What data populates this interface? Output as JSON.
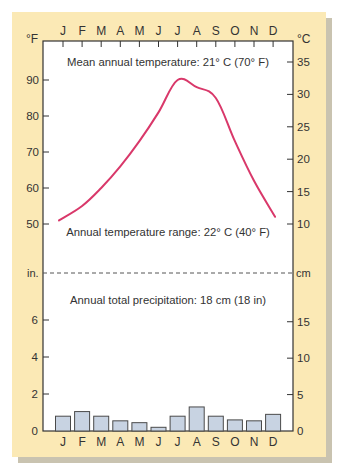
{
  "colors": {
    "panel": "#fbe9b5",
    "shadow": "#c9c3b0",
    "plot_bg": "#ffffff",
    "temp_line": "#d9386a",
    "bar_fill": "#c8d3e2",
    "bar_stroke": "#4a4a4a",
    "axis": "#333333"
  },
  "labels": {
    "left_top_unit": "°F",
    "right_top_unit": "°C",
    "left_precip_unit": "in.",
    "right_precip_unit": "cm",
    "mean_temp": "Mean annual temperature: 21° C (70° F)",
    "temp_range": "Annual temperature range: 22° C (40° F)",
    "precip_total": "Annual total precipitation: 18 cm (18 in)"
  },
  "chart_data": [
    {
      "type": "line",
      "title": "Mean annual temperature: 21° C (70° F)",
      "subtitle": "Annual temperature range: 22° C (40° F)",
      "categories": [
        "J",
        "F",
        "M",
        "A",
        "M",
        "J",
        "J",
        "A",
        "S",
        "O",
        "N",
        "D"
      ],
      "series": [
        {
          "name": "Temperature (°F)",
          "values": [
            51,
            55,
            60,
            66,
            73,
            81,
            90,
            88,
            85,
            73,
            62,
            52
          ]
        }
      ],
      "ylabel_left": "°F",
      "ylabel_right": "°C",
      "yticks_left": [
        50,
        60,
        70,
        80,
        90
      ],
      "yticks_right": [
        10,
        15,
        20,
        25,
        30,
        35
      ],
      "ylim": [
        45,
        97
      ],
      "grid": false,
      "legend": "none"
    },
    {
      "type": "bar",
      "title": "Annual total precipitation: 18 cm (18 in)",
      "categories": [
        "J",
        "F",
        "M",
        "A",
        "M",
        "J",
        "J",
        "A",
        "S",
        "O",
        "N",
        "D"
      ],
      "series": [
        {
          "name": "Precipitation (in)",
          "values": [
            0.8,
            1.05,
            0.8,
            0.55,
            0.45,
            0.2,
            0.8,
            1.3,
            0.8,
            0.6,
            0.55,
            0.9
          ]
        }
      ],
      "ylabel_left": "in.",
      "ylabel_right": "cm",
      "yticks_left": [
        0,
        2,
        4,
        6
      ],
      "yticks_right": [
        0,
        5,
        10,
        15
      ],
      "ylim": [
        0,
        8
      ],
      "grid": false,
      "legend": "none"
    }
  ]
}
